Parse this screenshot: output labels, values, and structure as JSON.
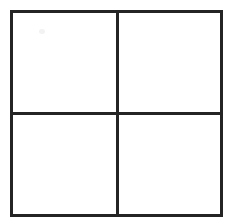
{
  "figure": {
    "title": "",
    "type": "grid",
    "rows": 2,
    "columns": 4,
    "cell_count": 4,
    "line_color": "#242424",
    "background_color": "#ffffff",
    "line_width_px": 3,
    "cells": [
      {
        "position": "top-left",
        "label": ""
      },
      {
        "position": "top-right",
        "label": ""
      },
      {
        "position": "bottom-left",
        "label": ""
      },
      {
        "position": "bottom-right",
        "label": ""
      }
    ]
  }
}
